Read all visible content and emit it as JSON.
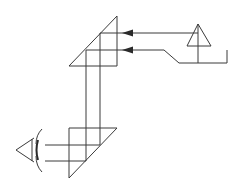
{
  "diagram": {
    "type": "optical-ray-diagram",
    "colors": {
      "line": "#3a3a3a",
      "background": "#ffffff"
    },
    "components": [
      {
        "name": "object-arrow",
        "description": "upright triangle object on the right"
      },
      {
        "name": "upper-prism",
        "description": "right-angle prism, top"
      },
      {
        "name": "lower-prism",
        "description": "right-angle prism, bottom"
      },
      {
        "name": "eye",
        "description": "observer eye on the left"
      }
    ],
    "rays": [
      {
        "name": "upper-ray",
        "path": "object → upper prism (y=33) → down x=100 → lower prism → eye (y=145)"
      },
      {
        "name": "lower-ray",
        "path": "object base → upper prism (y=50) → down x=86 → lower prism → eye (y=161)"
      }
    ]
  }
}
